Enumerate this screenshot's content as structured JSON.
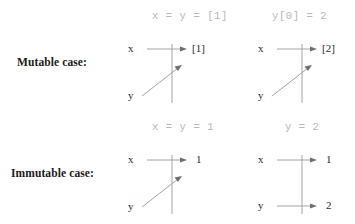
{
  "figure": {
    "title_alt": "Mutable versus immutable assignment aliasing diagram",
    "ink_color": "#8f8f8f",
    "text_color": "#2a2a2a",
    "header_color": "#b7b7b7",
    "background": "#ffffff"
  },
  "row_labels": {
    "mutable": "Mutable case:",
    "immutable": "Immutable case:"
  },
  "columns": {
    "left_header_mutable": "x = y = [1]",
    "right_header_mutable": "y[0] = 2",
    "left_header_immutable": "x = y = 1",
    "right_header_immutable": "y = 2"
  },
  "diagrams": {
    "mutable_before": {
      "name": "mutable-before",
      "var_top": "x",
      "var_bottom": "y",
      "value_top": "[1]",
      "value_bottom": "",
      "shared_target": true,
      "arrows": [
        "x-horizontal-arrow",
        "y-diagonal-arrow"
      ]
    },
    "mutable_after": {
      "name": "mutable-after",
      "var_top": "x",
      "var_bottom": "y",
      "value_top": "[2]",
      "value_bottom": "",
      "shared_target": true,
      "arrows": [
        "x-horizontal-arrow",
        "y-diagonal-arrow"
      ]
    },
    "immutable_before": {
      "name": "immutable-before",
      "var_top": "x",
      "var_bottom": "y",
      "value_top": "1",
      "value_bottom": "",
      "shared_target": true,
      "arrows": [
        "x-horizontal-arrow",
        "y-diagonal-arrow"
      ]
    },
    "immutable_after": {
      "name": "immutable-after",
      "var_top": "x",
      "var_bottom": "y",
      "value_top": "1",
      "value_bottom": "2",
      "shared_target": false,
      "arrows": [
        "x-horizontal-arrow",
        "y-horizontal-arrow"
      ]
    }
  }
}
